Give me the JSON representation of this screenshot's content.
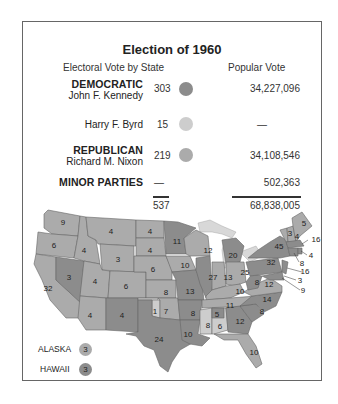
{
  "title": "Election of 1960",
  "headers": {
    "electoral": "Electoral Vote by State",
    "popular": "Popular Vote"
  },
  "colors": {
    "democratic": "#8c8c8c",
    "byrd": "#cdcdcd",
    "republican": "#ababab",
    "water": "#d8d8d8",
    "border": "#666666"
  },
  "rows": [
    {
      "party": "DEMOCRATIC",
      "candidate": "John F. Kennedy",
      "electoral": "303",
      "popular": "34,227,096"
    },
    {
      "party": "",
      "candidate": "Harry F. Byrd",
      "electoral": "15",
      "popular": "—"
    },
    {
      "party": "REPUBLICAN",
      "candidate": "Richard M. Nixon",
      "electoral": "219",
      "popular": "34,108,546"
    },
    {
      "party": "MINOR PARTIES",
      "candidate": "",
      "electoral": "—",
      "popular": "502,363"
    }
  ],
  "totals": {
    "electoral": "537",
    "popular": "68,838,005"
  },
  "legend": {
    "alaska": {
      "label": "ALASKA",
      "votes": "3",
      "party": "republican"
    },
    "hawaii": {
      "label": "HAWAII",
      "votes": "3",
      "party": "democratic"
    }
  },
  "map_labels": {
    "WA": "9",
    "OR": "6",
    "CA": "32",
    "ID": "4",
    "NV": "3",
    "MT": "4",
    "WY": "3",
    "UT": "4",
    "AZ": "4",
    "CO": "6",
    "NM": "4",
    "ND": "4",
    "SD": "4",
    "NE": "6",
    "KS": "8",
    "OK_byrd": "1",
    "OK": "7",
    "TX": "24",
    "MN": "11",
    "IA": "10",
    "MO": "13",
    "AR": "8",
    "LA": "10",
    "WI": "12",
    "IL": "27",
    "MI": "20",
    "IN": "13",
    "OH": "25",
    "KY": "10",
    "TN": "11",
    "MS": "8",
    "AL_dem": "5",
    "AL_byrd": "6",
    "GA": "12",
    "FL": "10",
    "SC": "8",
    "NC": "14",
    "VA": "12",
    "WV": "8",
    "PA": "32",
    "NY": "45",
    "VT": "3",
    "NH": "4",
    "ME": "5",
    "MA": "16",
    "RI": "4",
    "CT": "8",
    "NJ": "16",
    "DE": "3",
    "MD": "9"
  }
}
